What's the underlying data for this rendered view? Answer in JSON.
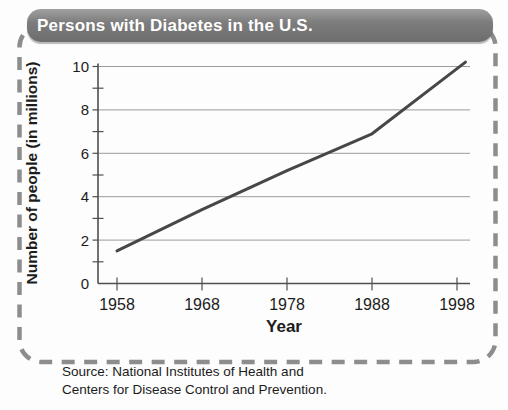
{
  "title_bar": {
    "text": "Persons with Diabetes in the U.S.",
    "bg_color": "#7d7d7d",
    "text_color": "#ffffff"
  },
  "chart_data": {
    "type": "line",
    "title": "Persons with Diabetes in the U.S.",
    "xlabel": "Year",
    "ylabel": "Number of people (in millions)",
    "x_ticks": [
      1958,
      1968,
      1978,
      1988,
      1998
    ],
    "y_ticks": [
      0,
      2,
      4,
      6,
      8,
      10
    ],
    "y_minor_ticks": [
      1,
      3,
      5,
      7,
      9
    ],
    "xlim": [
      1955.8,
      1999.5
    ],
    "ylim": [
      0,
      10
    ],
    "grid": "horizontal gridlines at major y ticks",
    "legend": "none",
    "series": [
      {
        "name": "Persons with diabetes (millions)",
        "points": [
          [
            1958,
            1.5
          ],
          [
            1968,
            3.4
          ],
          [
            1978,
            5.2
          ],
          [
            1988,
            6.9
          ],
          [
            1999,
            10.2
          ]
        ]
      }
    ]
  },
  "footer": {
    "source_line1": "Source: National Institutes of Health and",
    "source_line2": "Centers for Disease Control and Prevention."
  },
  "colors": {
    "data_line": "#474747",
    "gridline": "#909090",
    "axis": "#4f4f4f",
    "tick_text": "#1c1c1c",
    "dashed_border": "#8d8d8d"
  }
}
